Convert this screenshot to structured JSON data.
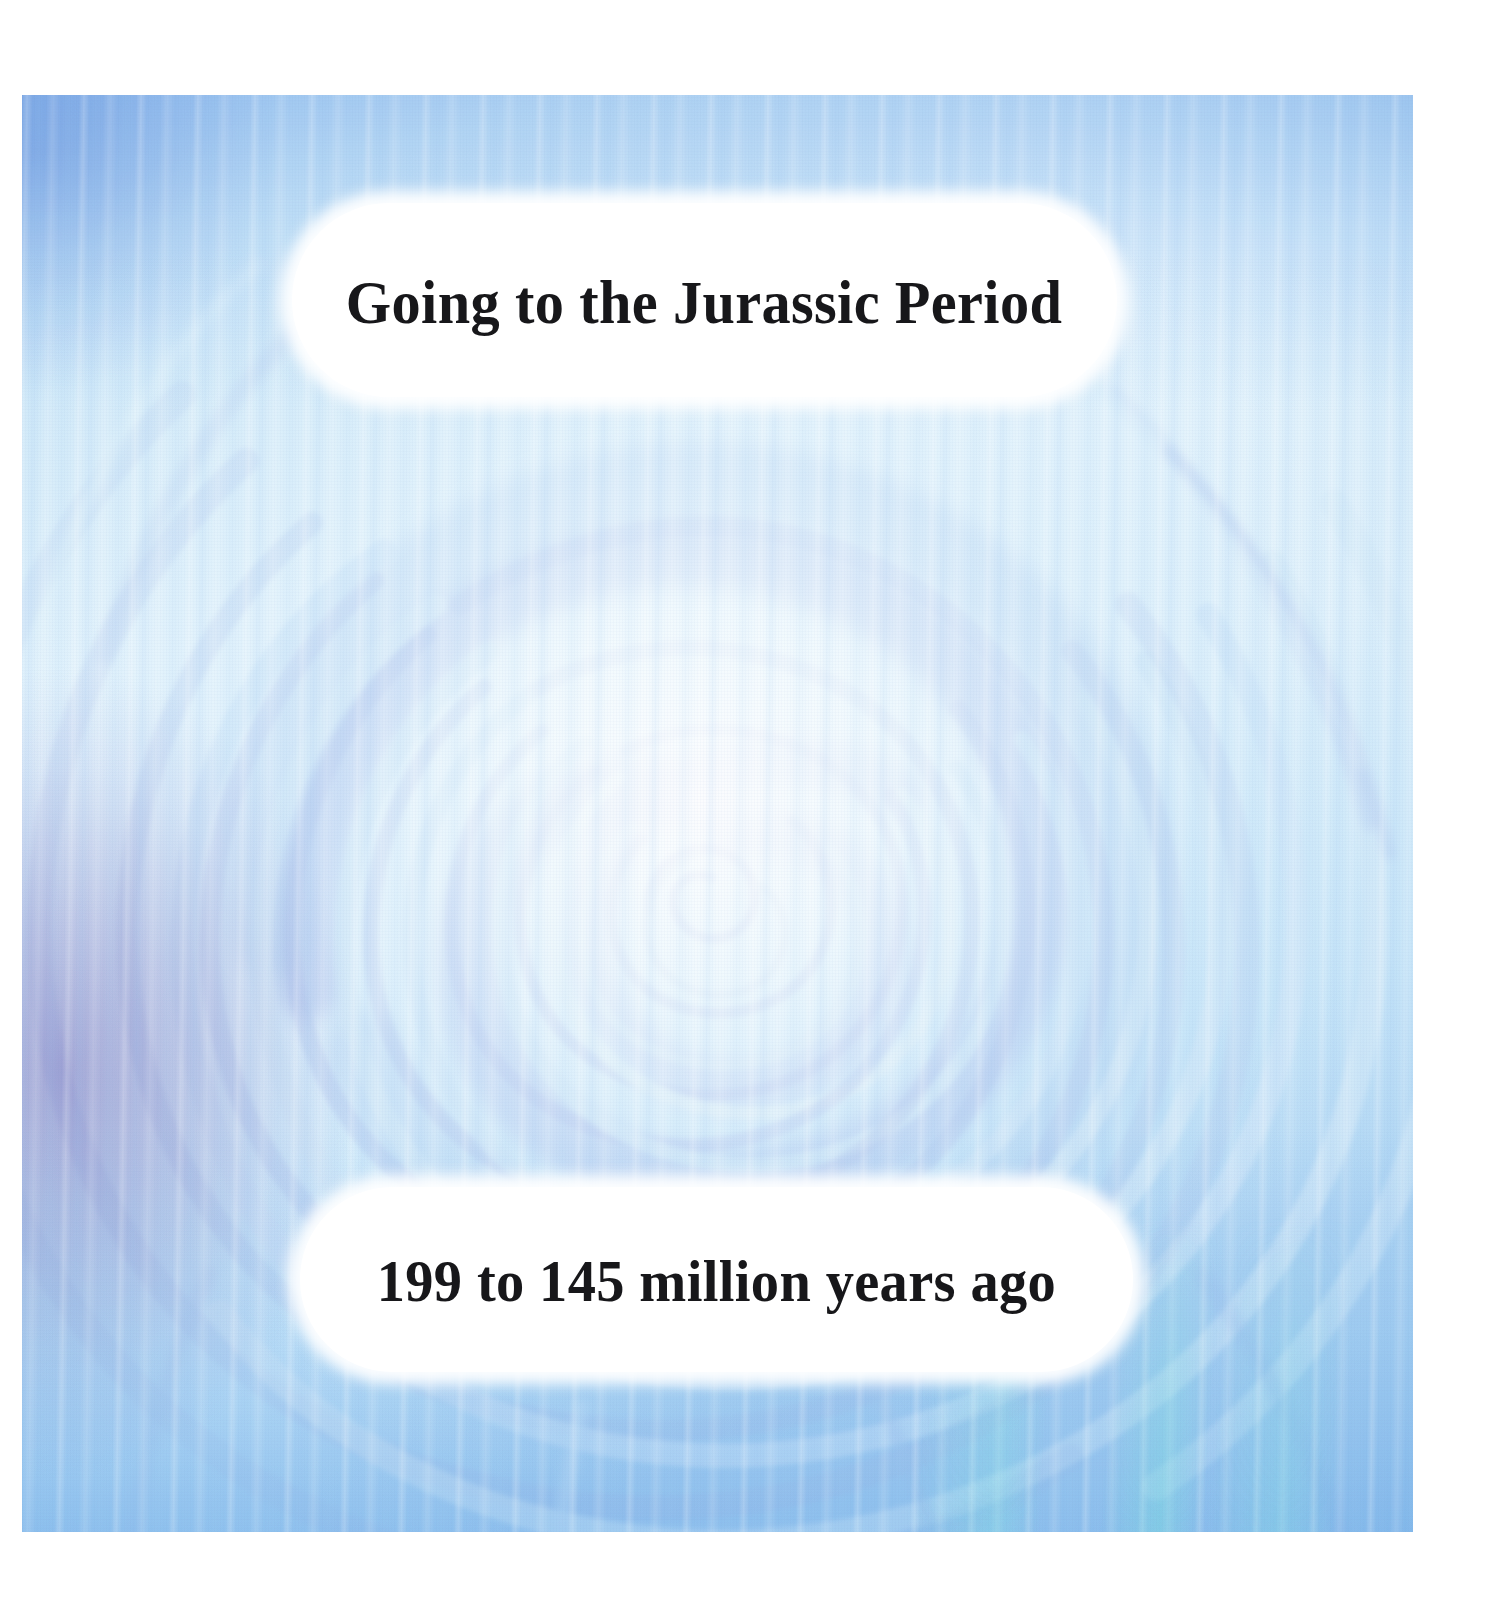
{
  "slide": {
    "title": "Going to the Jurassic Period",
    "subtitle": "199 to 145 million years ago"
  },
  "artwork": {
    "description": "twirl-swirl-vortex-watercolor",
    "palette": {
      "page_background": "#ffffff",
      "base_light_blue": "#cfe9f8",
      "highlight_near_white": "#f2fafd",
      "periwinkle_arc": "#8fa8e8",
      "soft_periwinkle": "#b5c4ea",
      "mid_blue": "#a8cdef",
      "lavender_patch": "#9b8fc4",
      "aqua_streak": "#7ee8e0",
      "pill_fill": "#ffffff",
      "caption_text": "#17171a"
    },
    "spiral_center": {
      "x": 700,
      "y": 800
    }
  }
}
